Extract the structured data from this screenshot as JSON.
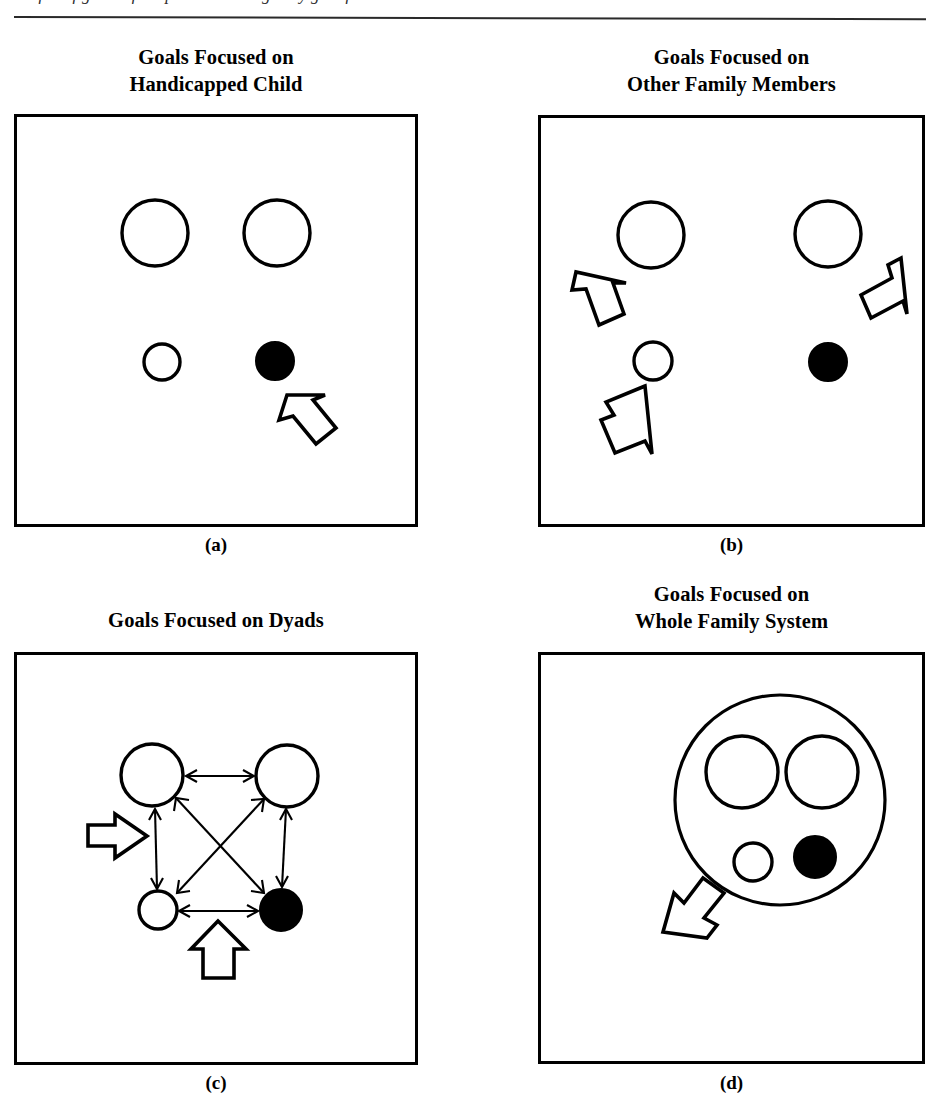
{
  "page": {
    "running_head": "of the figures of chapter are arranged by goal focus",
    "width": 940,
    "height": 1109,
    "background": "#ffffff",
    "ink_color": "#000000"
  },
  "panels": [
    {
      "id": "a",
      "title": "Goals Focused on\nHandicapped Child",
      "caption": "(a)",
      "box": {
        "x": 14,
        "y": 114,
        "w": 404,
        "h": 413
      },
      "circles": [
        {
          "name": "parent-left",
          "type": "open",
          "cx": 155,
          "cy": 233,
          "r": 33
        },
        {
          "name": "parent-right",
          "type": "open",
          "cx": 277,
          "cy": 233,
          "r": 33
        },
        {
          "name": "sibling",
          "type": "open",
          "cx": 162,
          "cy": 362,
          "r": 18
        },
        {
          "name": "handicapped-child",
          "type": "filled",
          "cx": 275,
          "cy": 361,
          "r": 19
        }
      ],
      "arrows": [
        {
          "name": "block-arrow-to-handicapped-child",
          "target": "handicapped-child",
          "direction": "up-left"
        }
      ]
    },
    {
      "id": "b",
      "title": "Goals Focused on\nOther Family Members",
      "caption": "(b)",
      "box": {
        "x": 538,
        "y": 115,
        "w": 387,
        "h": 412
      },
      "circles": [
        {
          "name": "parent-left",
          "type": "open",
          "cx": 651,
          "cy": 235,
          "r": 33
        },
        {
          "name": "parent-right",
          "type": "open",
          "cx": 828,
          "cy": 234,
          "r": 33
        },
        {
          "name": "sibling",
          "type": "open",
          "cx": 653,
          "cy": 361,
          "r": 19
        },
        {
          "name": "handicapped-child",
          "type": "filled",
          "cx": 828,
          "cy": 362,
          "r": 19
        }
      ],
      "arrows": [
        {
          "name": "block-arrow-to-parent-left",
          "target": "parent-left",
          "direction": "up-left"
        },
        {
          "name": "block-arrow-to-parent-right",
          "target": "parent-right",
          "direction": "up-right"
        },
        {
          "name": "block-arrow-to-sibling",
          "target": "sibling",
          "direction": "up"
        }
      ]
    },
    {
      "id": "c",
      "title": "Goals Focused on Dyads",
      "caption": "(c)",
      "box": {
        "x": 14,
        "y": 652,
        "w": 404,
        "h": 413
      },
      "circles": [
        {
          "name": "parent-left",
          "type": "open",
          "cx": 152,
          "cy": 775,
          "r": 31
        },
        {
          "name": "parent-right",
          "type": "open",
          "cx": 287,
          "cy": 776,
          "r": 31
        },
        {
          "name": "sibling",
          "type": "open",
          "cx": 158,
          "cy": 910,
          "r": 19
        },
        {
          "name": "handicapped-child",
          "type": "filled",
          "cx": 281,
          "cy": 910,
          "r": 21
        }
      ],
      "dyad_links": [
        {
          "from": "parent-left",
          "to": "parent-right",
          "bidirectional": true
        },
        {
          "from": "parent-left",
          "to": "sibling",
          "bidirectional": true
        },
        {
          "from": "parent-right",
          "to": "handicapped-child",
          "bidirectional": true
        },
        {
          "from": "sibling",
          "to": "handicapped-child",
          "bidirectional": true
        },
        {
          "from": "parent-left",
          "to": "handicapped-child",
          "bidirectional": true
        },
        {
          "from": "parent-right",
          "to": "sibling",
          "bidirectional": true
        }
      ],
      "arrows": [
        {
          "name": "block-arrow-left",
          "target": "dyad-cluster",
          "direction": "right"
        },
        {
          "name": "block-arrow-bottom",
          "target": "dyad-cluster",
          "direction": "up"
        }
      ]
    },
    {
      "id": "d",
      "title": "Goals Focused on\nWhole Family System",
      "caption": "(d)",
      "box": {
        "x": 538,
        "y": 652,
        "w": 387,
        "h": 412
      },
      "system_circle": {
        "name": "whole-family-system",
        "cx": 780,
        "cy": 800,
        "r": 105
      },
      "circles": [
        {
          "name": "parent-left",
          "type": "open",
          "cx": 742,
          "cy": 772,
          "r": 36
        },
        {
          "name": "parent-right",
          "type": "open",
          "cx": 822,
          "cy": 772,
          "r": 36
        },
        {
          "name": "sibling",
          "type": "open",
          "cx": 753,
          "cy": 862,
          "r": 19
        },
        {
          "name": "handicapped-child",
          "type": "filled",
          "cx": 815,
          "cy": 857,
          "r": 21
        }
      ],
      "arrows": [
        {
          "name": "block-arrow-to-system",
          "target": "whole-family-system",
          "direction": "up-right"
        }
      ]
    }
  ],
  "legend": {
    "open_large_circle": "parent",
    "open_small_circle": "sibling",
    "filled_small_circle": "handicapped child",
    "block_arrow": "goal focus"
  }
}
